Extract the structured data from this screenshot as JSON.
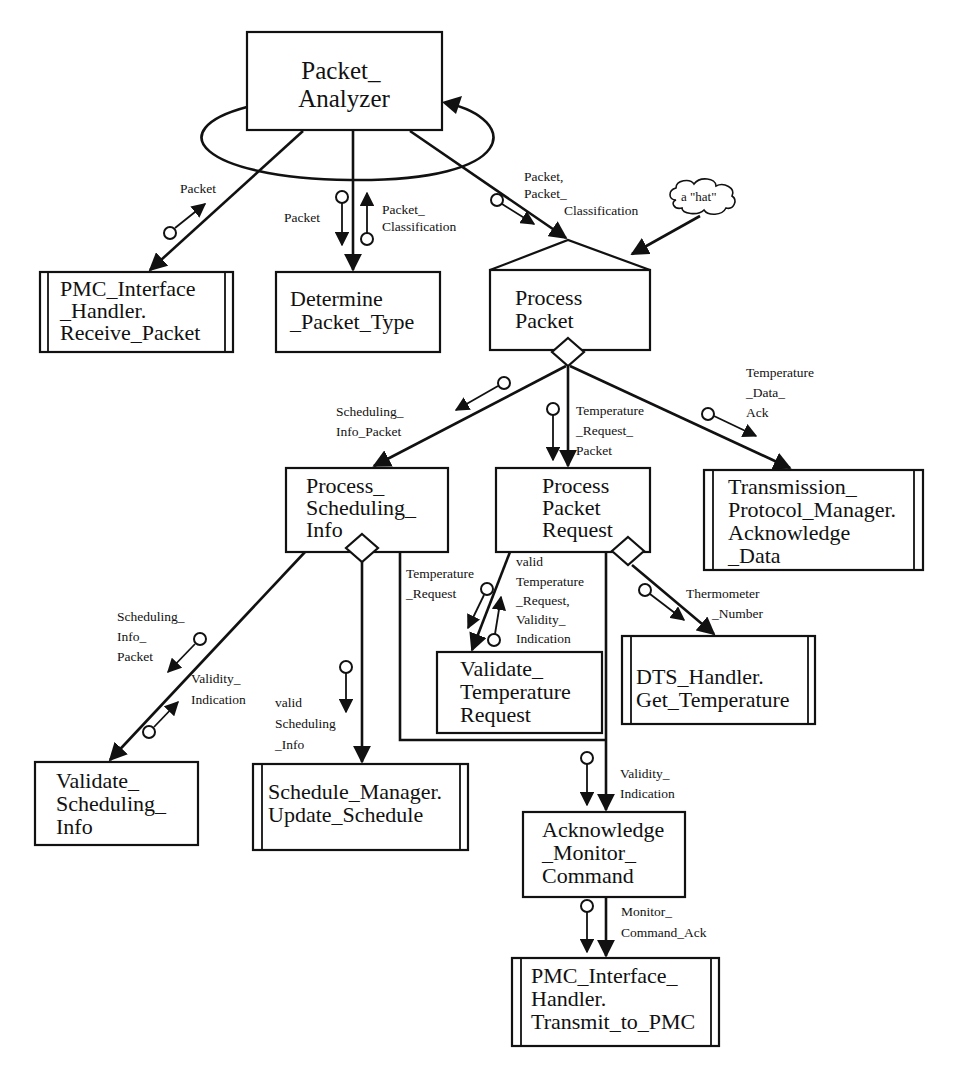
{
  "modules": {
    "packet_analyzer": [
      "Packet_",
      "Analyzer"
    ],
    "receive_packet": [
      "PMC_Interface",
      "_Handler.",
      "Receive_Packet"
    ],
    "determine_packet_type": [
      "Determine",
      "_Packet_Type"
    ],
    "process_packet": [
      "Process",
      "Packet"
    ],
    "process_scheduling_info": [
      "Process_",
      "Scheduling_",
      "Info"
    ],
    "process_packet_request": [
      "Process",
      "Packet",
      "Request"
    ],
    "acknowledge_data": [
      "Transmission_",
      "Protocol_Manager.",
      "Acknowledge",
      "_Data"
    ],
    "validate_temperature_request": [
      "Validate_",
      "Temperature",
      "Request"
    ],
    "get_temperature": [
      "DTS_Handler.",
      "Get_Temperature"
    ],
    "validate_scheduling_info": [
      "Validate_",
      "Scheduling_",
      "Info"
    ],
    "update_schedule": [
      "Schedule_Manager.",
      "Update_Schedule"
    ],
    "acknowledge_monitor_command": [
      "Acknowledge",
      "_Monitor_",
      "Command"
    ],
    "transmit_to_pmc": [
      "PMC_Interface_",
      "Handler.",
      "Transmit_to_PMC"
    ]
  },
  "annotations": {
    "hat": "a \"hat\""
  },
  "couples": {
    "packet_receive": [
      "Packet"
    ],
    "packet_determine": [
      "Packet"
    ],
    "packet_classification": [
      "Packet_",
      "Classification"
    ],
    "packet_and_class": [
      "Packet,",
      "Packet_",
      "Classification"
    ],
    "scheduling_info_packet": [
      "Scheduling_",
      "Info_Packet"
    ],
    "temperature_request_packet": [
      "Temperature",
      "_Request_",
      "Packet"
    ],
    "temperature_data_ack": [
      "Temperature",
      "_Data_",
      "Ack"
    ],
    "sched_info_packet_2": [
      "Scheduling_",
      "Info_",
      "Packet"
    ],
    "validity_indication_1": [
      "Validity_",
      "Indication"
    ],
    "valid_scheduling_info": [
      "valid",
      "Scheduling",
      "_Info"
    ],
    "temperature_request": [
      "Temperature",
      "_Request"
    ],
    "valid_temp_request": [
      "valid",
      "Temperature",
      "_Request,",
      "Validity_",
      "Indication"
    ],
    "thermometer_number": [
      "Thermometer",
      "_Number"
    ],
    "validity_indication_2": [
      "Validity_",
      "Indication"
    ],
    "monitor_command_ack": [
      "Monitor_",
      "Command_Ack"
    ]
  }
}
